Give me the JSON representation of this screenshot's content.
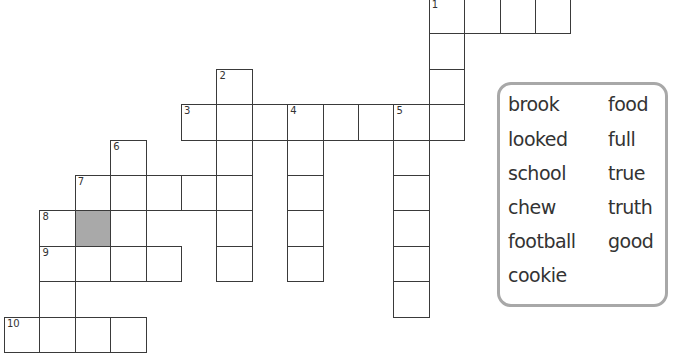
{
  "puzzle": {
    "cell_size": 35.4,
    "origin_x": 4,
    "origin_y": -2,
    "cells": [
      {
        "r": 0,
        "c": 12,
        "n": "1"
      },
      {
        "r": 0,
        "c": 13
      },
      {
        "r": 0,
        "c": 14
      },
      {
        "r": 0,
        "c": 15
      },
      {
        "r": 1,
        "c": 12
      },
      {
        "r": 2,
        "c": 12
      },
      {
        "r": 2,
        "c": 6,
        "n": "2"
      },
      {
        "r": 3,
        "c": 5,
        "n": "3"
      },
      {
        "r": 3,
        "c": 6
      },
      {
        "r": 3,
        "c": 7
      },
      {
        "r": 3,
        "c": 8,
        "n": "4"
      },
      {
        "r": 3,
        "c": 9
      },
      {
        "r": 3,
        "c": 10
      },
      {
        "r": 3,
        "c": 11,
        "n": "5"
      },
      {
        "r": 3,
        "c": 12
      },
      {
        "r": 4,
        "c": 3,
        "n": "6"
      },
      {
        "r": 4,
        "c": 6
      },
      {
        "r": 4,
        "c": 8
      },
      {
        "r": 4,
        "c": 11
      },
      {
        "r": 5,
        "c": 2,
        "n": "7"
      },
      {
        "r": 5,
        "c": 3
      },
      {
        "r": 5,
        "c": 4
      },
      {
        "r": 5,
        "c": 5
      },
      {
        "r": 5,
        "c": 6
      },
      {
        "r": 5,
        "c": 8
      },
      {
        "r": 5,
        "c": 11
      },
      {
        "r": 6,
        "c": 1,
        "n": "8"
      },
      {
        "r": 6,
        "c": 2,
        "shaded": true
      },
      {
        "r": 6,
        "c": 3
      },
      {
        "r": 6,
        "c": 6
      },
      {
        "r": 6,
        "c": 8
      },
      {
        "r": 6,
        "c": 11
      },
      {
        "r": 7,
        "c": 1,
        "n": "9"
      },
      {
        "r": 7,
        "c": 2
      },
      {
        "r": 7,
        "c": 3
      },
      {
        "r": 7,
        "c": 4
      },
      {
        "r": 7,
        "c": 6
      },
      {
        "r": 7,
        "c": 8
      },
      {
        "r": 7,
        "c": 11
      },
      {
        "r": 8,
        "c": 1
      },
      {
        "r": 8,
        "c": 11
      },
      {
        "r": 9,
        "c": 0,
        "n": "10"
      },
      {
        "r": 9,
        "c": 1
      },
      {
        "r": 9,
        "c": 2
      },
      {
        "r": 9,
        "c": 3
      }
    ]
  },
  "word_bank": {
    "left_column": [
      "brook",
      "looked",
      "school",
      "chew",
      "football",
      "cookie"
    ],
    "right_column": [
      "food",
      "full",
      "true",
      "truth",
      "good"
    ]
  }
}
